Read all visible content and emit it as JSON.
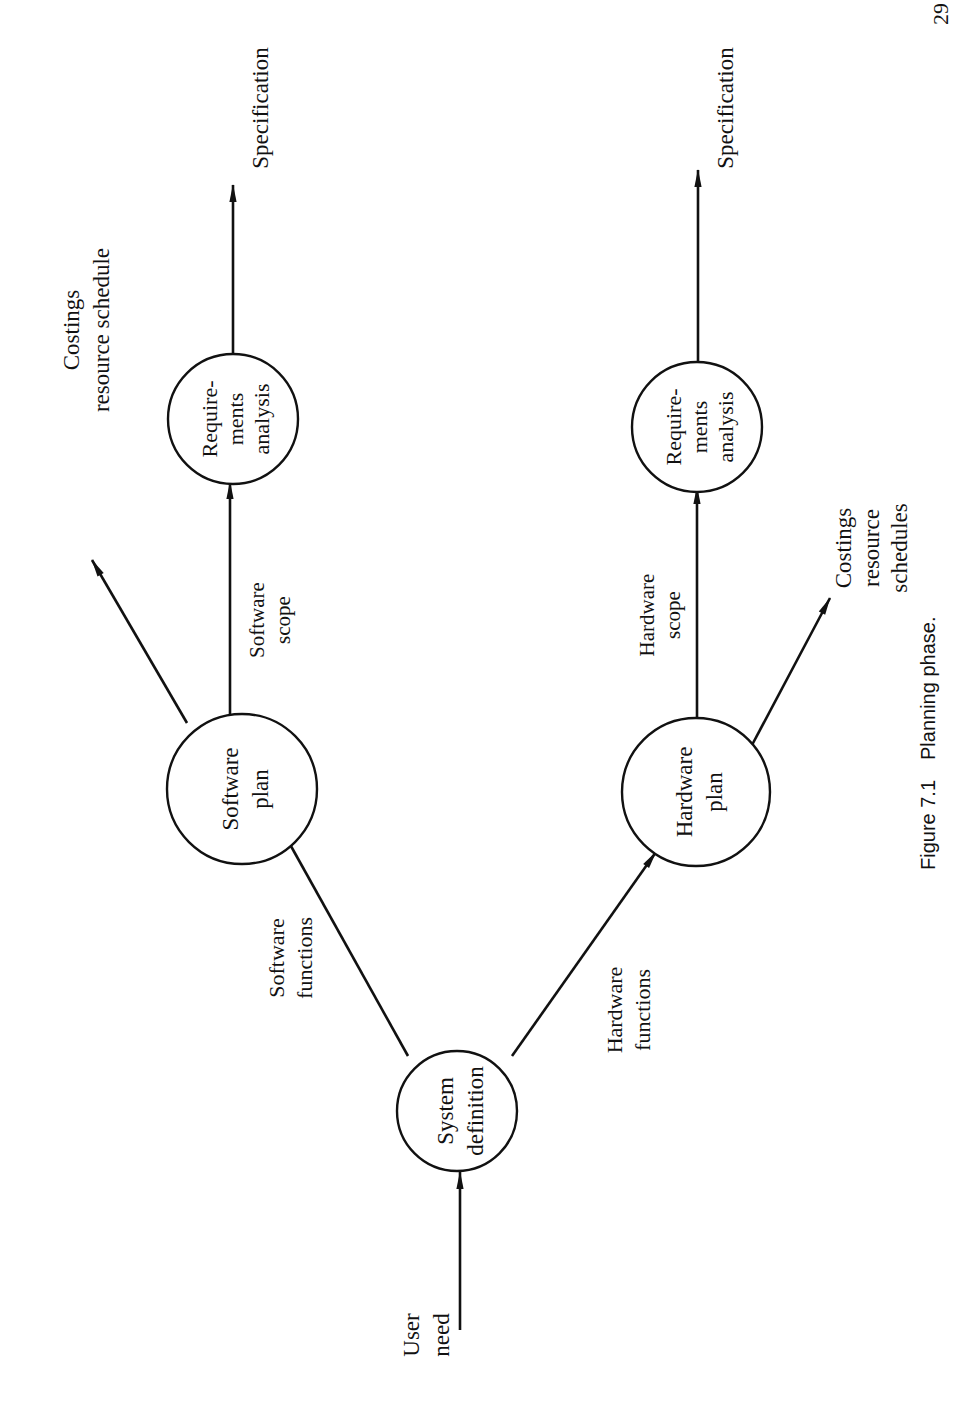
{
  "page": {
    "orientation": "rotated-90-ccw",
    "page_number": "29"
  },
  "figure": {
    "number": "Figure 7.1",
    "caption": "Planning phase."
  },
  "nodes": {
    "system_definition": {
      "line1": "System",
      "line2": "definition"
    },
    "software_plan": {
      "line1": "Software",
      "line2": "plan"
    },
    "hardware_plan": {
      "line1": "Hardware",
      "line2": "plan"
    },
    "sw_requirements": {
      "line1": "Require-",
      "line2": "ments",
      "line3": "analysis"
    },
    "hw_requirements": {
      "line1": "Require-",
      "line2": "ments",
      "line3": "analysis"
    }
  },
  "edges": {
    "user_need": {
      "line1": "User",
      "line2": "need"
    },
    "software_functions": {
      "line1": "Software",
      "line2": "functions"
    },
    "hardware_functions": {
      "line1": "Hardware",
      "line2": "functions"
    },
    "software_scope": {
      "line1": "Software",
      "line2": "scope"
    },
    "hardware_scope": {
      "line1": "Hardware",
      "line2": "scope"
    },
    "sw_costings": {
      "line1": "Costings",
      "line2": "resource schedule"
    },
    "hw_costings": {
      "line1": "Costings",
      "line2": "resource",
      "line3": "schedules"
    },
    "sw_specification": {
      "line1": "Specification"
    },
    "hw_specification": {
      "line1": "Specification"
    }
  }
}
